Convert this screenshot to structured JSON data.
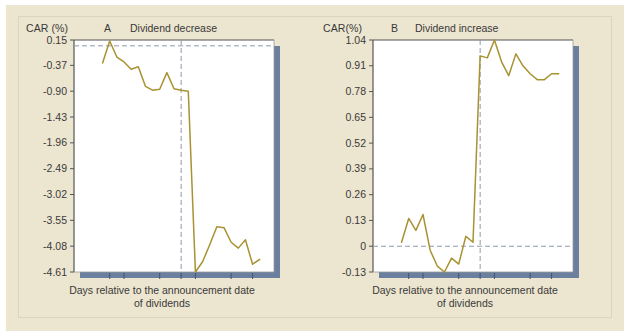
{
  "figure": {
    "background_color": "#ece5cf",
    "line_color": "#a89232",
    "plot_bg_color": "#ffffff",
    "shadow_color": "#6b7f9e",
    "axis_color": "#555555",
    "ref_line_color": "#8f99ad",
    "panels": [
      "A",
      "B"
    ]
  },
  "panel_a": {
    "letter": "A",
    "title": "Dividend decrease",
    "y_axis_title": "CAR (%)",
    "x_axis_title_line1": "Days relative to the announcement date",
    "x_axis_title_line2": "of dividends",
    "y_ticks": [
      "0.15",
      "-0.37",
      "-0.90",
      "-1.43",
      "-1.96",
      "-2.49",
      "-3.02",
      "-3.55",
      "-4.08",
      "-4.61"
    ],
    "x_ticks": [
      "-10",
      "-8",
      "-3",
      "AD",
      "2",
      "7",
      "10"
    ]
  },
  "panel_b": {
    "letter": "B",
    "title": "Dividend increase",
    "y_axis_title": "CAR(%)",
    "x_axis_title_line1": "Days relative to the announcement date",
    "x_axis_title_line2": "of dividends",
    "y_ticks": [
      "1.04",
      "0.91",
      "0.78",
      "0.65",
      "0.52",
      "0.39",
      "0.26",
      "0.13",
      "0",
      "-0.13"
    ],
    "x_ticks": [
      "-10",
      "-8",
      "-3",
      "AD",
      "2",
      "7",
      "10"
    ]
  },
  "chart_data": [
    {
      "type": "line",
      "panel": "A",
      "title": "Dividend decrease",
      "xlabel": "Days relative to the announcement date of dividends",
      "ylabel": "CAR (%)",
      "xlim": [
        -15,
        13
      ],
      "ylim": [
        -4.61,
        0.15
      ],
      "ytick_values": [
        0.15,
        -0.37,
        -0.9,
        -1.43,
        -1.96,
        -2.49,
        -3.02,
        -3.55,
        -4.08,
        -4.61
      ],
      "ytick_labels": [
        "0.15",
        "-0.37",
        "-0.90",
        "-1.43",
        "-1.96",
        "-2.49",
        "-3.02",
        "-3.55",
        "-4.08",
        "-4.61"
      ],
      "xtick_values": [
        -10,
        -8,
        -3,
        0,
        2,
        7,
        10
      ],
      "xtick_labels": [
        "-10",
        "-8",
        "-3",
        "AD",
        "2",
        "7",
        "10"
      ],
      "grid": false,
      "legend": "none",
      "hline_value": 0.03,
      "vline_value": 0,
      "vline_label": "AD",
      "x": [
        -11,
        -10,
        -9,
        -8,
        -7,
        -6,
        -5,
        -4,
        -3,
        -2,
        -1,
        0,
        1,
        2,
        3,
        4,
        5,
        6,
        7,
        8,
        9,
        10,
        11
      ],
      "values": [
        -0.32,
        0.13,
        -0.2,
        -0.3,
        -0.45,
        -0.4,
        -0.8,
        -0.88,
        -0.86,
        -0.52,
        -0.85,
        -0.88,
        -0.9,
        -4.61,
        -4.4,
        -4.05,
        -3.68,
        -3.7,
        -4.0,
        -4.12,
        -3.95,
        -4.45,
        -4.35
      ]
    },
    {
      "type": "line",
      "panel": "B",
      "title": "Dividend increase",
      "xlabel": "Days relative to the announcement date of dividends",
      "ylabel": "CAR(%)",
      "xlim": [
        -15,
        13
      ],
      "ylim": [
        -0.13,
        1.04
      ],
      "ytick_values": [
        1.04,
        0.91,
        0.78,
        0.65,
        0.52,
        0.39,
        0.26,
        0.13,
        0,
        -0.13
      ],
      "ytick_labels": [
        "1.04",
        "0.91",
        "0.78",
        "0.65",
        "0.52",
        "0.39",
        "0.26",
        "0.13",
        "0",
        "-0.13"
      ],
      "xtick_values": [
        -10,
        -8,
        -3,
        0,
        2,
        7,
        10
      ],
      "xtick_labels": [
        "-10",
        "-8",
        "-3",
        "AD",
        "2",
        "7",
        "10"
      ],
      "grid": false,
      "legend": "none",
      "hline_value": 0,
      "vline_value": 0,
      "vline_label": "AD",
      "x": [
        -11,
        -10,
        -9,
        -8,
        -7,
        -6,
        -5,
        -4,
        -3,
        -2,
        -1,
        0,
        1,
        2,
        3,
        4,
        5,
        6,
        7,
        8,
        9,
        10,
        11
      ],
      "values": [
        0.02,
        0.14,
        0.08,
        0.16,
        -0.02,
        -0.1,
        -0.13,
        -0.06,
        -0.09,
        0.05,
        0.02,
        0.96,
        0.95,
        1.04,
        0.93,
        0.86,
        0.97,
        0.91,
        0.87,
        0.84,
        0.84,
        0.87,
        0.87
      ]
    }
  ]
}
